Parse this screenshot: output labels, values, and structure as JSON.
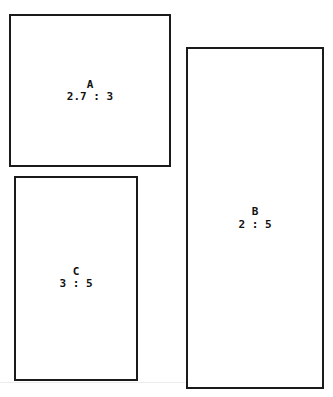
{
  "diagram": {
    "title": "",
    "rectangles": [
      {
        "id": "A",
        "name": "A",
        "ratio": "2.7 : 3"
      },
      {
        "id": "B",
        "name": "B",
        "ratio": "2 : 5"
      },
      {
        "id": "C",
        "name": "C",
        "ratio": "3 : 5"
      }
    ]
  }
}
